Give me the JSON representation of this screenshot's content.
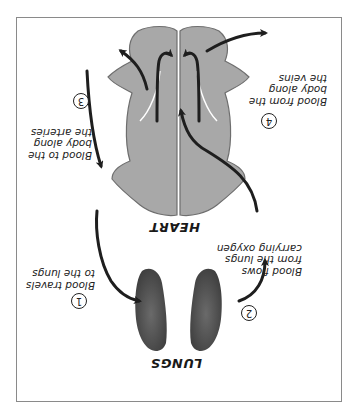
{
  "diagram": {
    "orientation": "rotated 180 degrees (upside down)",
    "colors": {
      "heart_fill": "#a8a8a8",
      "heart_outline": "#6e6e6e",
      "lung_fill": "#5a5a5a",
      "arrow": "#1e1e1e",
      "frame": "#8a8a8a",
      "background": "#ffffff"
    },
    "labels": {
      "heart": "HEART",
      "lungs": "LUNGS"
    },
    "steps": [
      {
        "number": "1",
        "lines": [
          "Blood travels",
          "to the lungs"
        ]
      },
      {
        "number": "2",
        "lines": [
          "Blood flows",
          "from the lungs",
          "carrying oxygen"
        ]
      },
      {
        "number": "3",
        "lines": [
          "Blood to the",
          "body along",
          "the arteries"
        ]
      },
      {
        "number": "4",
        "lines": [
          "Blood from the",
          "body along",
          "the veins"
        ]
      }
    ]
  }
}
